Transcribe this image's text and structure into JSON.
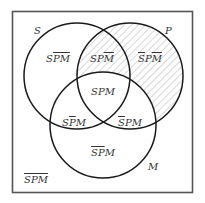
{
  "diagram": {
    "type": "venn-3",
    "colors": {
      "stroke": "#1a1a1a",
      "box": "#555555",
      "hatch": "#9a9a9a",
      "text": "#333333"
    },
    "sets": [
      {
        "name": "S",
        "label": "S"
      },
      {
        "name": "P",
        "label": "P"
      },
      {
        "name": "M",
        "label": "M"
      }
    ],
    "regions": [
      {
        "id": "s-only",
        "label": "SP̅M̅",
        "parts": [
          {
            "t": "S",
            "bar": false
          },
          {
            "t": "PM",
            "bar": true
          }
        ],
        "shaded": false
      },
      {
        "id": "sp-not-m",
        "label": "SPM̅",
        "parts": [
          {
            "t": "SP",
            "bar": false
          },
          {
            "t": "M",
            "bar": true
          }
        ],
        "shaded": true
      },
      {
        "id": "p-only",
        "label": "S̅PM̅",
        "parts": [
          {
            "t": "S",
            "bar": true
          },
          {
            "t": "P",
            "bar": false
          },
          {
            "t": "M",
            "bar": true
          }
        ],
        "shaded": true
      },
      {
        "id": "spm",
        "label": "SPM",
        "parts": [
          {
            "t": "SPM",
            "bar": false
          }
        ],
        "shaded": false
      },
      {
        "id": "sm-not-p",
        "label": "SP̅M",
        "parts": [
          {
            "t": "S",
            "bar": false
          },
          {
            "t": "P",
            "bar": true
          },
          {
            "t": "M",
            "bar": false
          }
        ],
        "shaded": false
      },
      {
        "id": "pm-not-s",
        "label": "S̅PM",
        "parts": [
          {
            "t": "S",
            "bar": true
          },
          {
            "t": "PM",
            "bar": false
          }
        ],
        "shaded": false
      },
      {
        "id": "m-only",
        "label": "S̅P̅M",
        "parts": [
          {
            "t": "SP",
            "bar": true
          },
          {
            "t": "M",
            "bar": false
          }
        ],
        "shaded": false
      },
      {
        "id": "none",
        "label": "S̅P̅M̅",
        "parts": [
          {
            "t": "SPM",
            "bar": true
          }
        ],
        "shaded": false
      }
    ],
    "shaded_description": "P outside M (SPM̅ and S̅PM̅) is hatched"
  }
}
